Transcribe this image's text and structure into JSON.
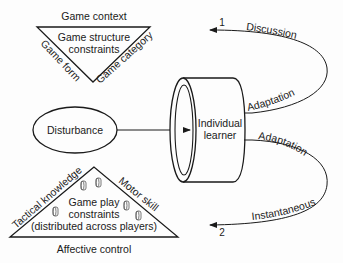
{
  "diagram": {
    "top_triangle": {
      "title": "Game context",
      "center_line1": "Game structure",
      "center_line2": "constraints",
      "left_side": "Game form",
      "right_side": "Game category"
    },
    "disturbance": {
      "label": "Disturbance"
    },
    "learner": {
      "line1": "Individual",
      "line2": "learner"
    },
    "loop_upper": {
      "number": "1",
      "top_label": "Discussion",
      "bottom_label": "Adaptation"
    },
    "loop_lower": {
      "number": "2",
      "top_label": "Adaptation",
      "bottom_label": "Instantaneous"
    },
    "bottom_triangle": {
      "left_side": "Tactical knowledge",
      "right_side": "Motor skill",
      "center_line1": "Game play",
      "center_line2": "constraints",
      "center_line3": "(distributed across players)",
      "base": "Affective control"
    },
    "colors": {
      "stroke": "#1a1a1a",
      "background": "#fdfdfd"
    }
  }
}
